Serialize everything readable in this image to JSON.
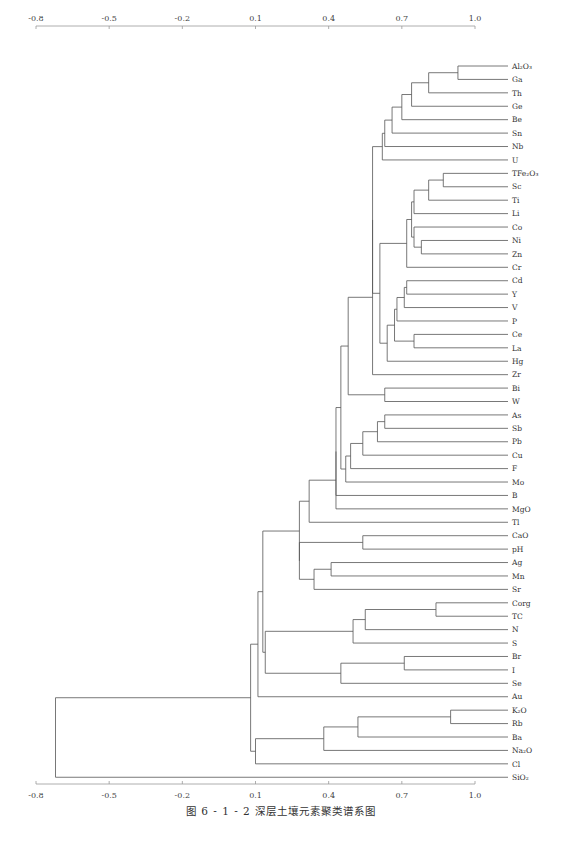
{
  "chart_data": {
    "type": "dendrogram",
    "xlabel": "",
    "ylabel": "",
    "x_ticks": [
      -0.8,
      -0.5,
      -0.2,
      0.1,
      0.4,
      0.7,
      1.0
    ],
    "x_tick_labels": [
      "-0.8",
      "-0.5",
      "-0.2",
      "0.1",
      "0.4",
      "0.7",
      "1.0"
    ],
    "xlim": [
      -0.8,
      1.0
    ],
    "axes": [
      "top",
      "bottom"
    ],
    "grid": false,
    "leaves": [
      "Al2O3",
      "Ga",
      "Th",
      "Ge",
      "Be",
      "Sn",
      "Nb",
      "U",
      "TFe2O3",
      "Sc",
      "Ti",
      "Li",
      "Co",
      "Ni",
      "Zn",
      "Cr",
      "Cd",
      "Y",
      "V",
      "P",
      "Ce",
      "La",
      "Hg",
      "Zr",
      "Bi",
      "W",
      "As",
      "Sb",
      "Pb",
      "Cu",
      "F",
      "Mo",
      "B",
      "MgO",
      "Tl",
      "CaO",
      "pH",
      "Ag",
      "Mn",
      "Sr",
      "Corg",
      "TC",
      "N",
      "S",
      "Br",
      "I",
      "Se",
      "Au",
      "K2O",
      "Rb",
      "Ba",
      "Na2O",
      "Cl",
      "SiO2"
    ],
    "leaf_display": [
      "Al₂O₃",
      "Ga",
      "Th",
      "Ge",
      "Be",
      "Sn",
      "Nb",
      "U",
      "TFe₂O₃",
      "Sc",
      "Ti",
      "Li",
      "Co",
      "Ni",
      "Zn",
      "Cr",
      "Cd",
      "Y",
      "V",
      "P",
      "Ce",
      "La",
      "Hg",
      "Zr",
      "Bi",
      "W",
      "As",
      "Sb",
      "Pb",
      "Cu",
      "F",
      "Mo",
      "B",
      "MgO",
      "Tl",
      "CaO",
      "pH",
      "Ag",
      "Mn",
      "Sr",
      "Corg",
      "TC",
      "N",
      "S",
      "Br",
      "I",
      "Se",
      "Au",
      "K₂O",
      "Rb",
      "Ba",
      "Na₂O",
      "Cl",
      "SiO₂"
    ],
    "merges": [
      {
        "id": "n1",
        "a": "Al2O3",
        "b": "Ga",
        "sim": 0.93
      },
      {
        "id": "n2",
        "a": "n1",
        "b": "Th",
        "sim": 0.81
      },
      {
        "id": "n3",
        "a": "n2",
        "b": "Ge",
        "sim": 0.74
      },
      {
        "id": "n4",
        "a": "n3",
        "b": "Be",
        "sim": 0.7
      },
      {
        "id": "n5",
        "a": "n4",
        "b": "Sn",
        "sim": 0.66
      },
      {
        "id": "n6",
        "a": "n5",
        "b": "Nb",
        "sim": 0.63
      },
      {
        "id": "n7",
        "a": "n6",
        "b": "U",
        "sim": 0.62
      },
      {
        "id": "n8",
        "a": "TFe2O3",
        "b": "Sc",
        "sim": 0.87
      },
      {
        "id": "n9",
        "a": "n8",
        "b": "Ti",
        "sim": 0.81
      },
      {
        "id": "n10",
        "a": "n9",
        "b": "Li",
        "sim": 0.75
      },
      {
        "id": "n11",
        "a": "Ni",
        "b": "Zn",
        "sim": 0.78
      },
      {
        "id": "n12",
        "a": "Co",
        "b": "n11",
        "sim": 0.75
      },
      {
        "id": "n13",
        "a": "n10",
        "b": "n12",
        "sim": 0.74
      },
      {
        "id": "n14",
        "a": "n13",
        "b": "Cr",
        "sim": 0.72
      },
      {
        "id": "n15",
        "a": "Cd",
        "b": "Y",
        "sim": 0.72
      },
      {
        "id": "n16",
        "a": "n15",
        "b": "V",
        "sim": 0.71
      },
      {
        "id": "n17",
        "a": "n16",
        "b": "P",
        "sim": 0.68
      },
      {
        "id": "n18",
        "a": "Ce",
        "b": "La",
        "sim": 0.75
      },
      {
        "id": "n19",
        "a": "n17",
        "b": "n18",
        "sim": 0.67
      },
      {
        "id": "n20",
        "a": "n19",
        "b": "Hg",
        "sim": 0.64
      },
      {
        "id": "n21",
        "a": "n14",
        "b": "n20",
        "sim": 0.61
      },
      {
        "id": "n22",
        "a": "n7",
        "b": "n21",
        "sim": 0.58
      },
      {
        "id": "n23",
        "a": "n22",
        "b": "Zr",
        "sim": 0.58
      },
      {
        "id": "n24",
        "a": "Bi",
        "b": "W",
        "sim": 0.63
      },
      {
        "id": "n25",
        "a": "n23",
        "b": "n24",
        "sim": 0.48
      },
      {
        "id": "n26",
        "a": "As",
        "b": "Sb",
        "sim": 0.63
      },
      {
        "id": "n27",
        "a": "n26",
        "b": "Pb",
        "sim": 0.6
      },
      {
        "id": "n28",
        "a": "n27",
        "b": "Cu",
        "sim": 0.54
      },
      {
        "id": "n29",
        "a": "n28",
        "b": "F",
        "sim": 0.49
      },
      {
        "id": "n30",
        "a": "n29",
        "b": "Mo",
        "sim": 0.47
      },
      {
        "id": "n31",
        "a": "n25",
        "b": "n30",
        "sim": 0.45
      },
      {
        "id": "n32",
        "a": "n31",
        "b": "B",
        "sim": 0.43
      },
      {
        "id": "n33",
        "a": "n32",
        "b": "MgO",
        "sim": 0.43
      },
      {
        "id": "n34",
        "a": "n33",
        "b": "Tl",
        "sim": 0.32
      },
      {
        "id": "n35",
        "a": "CaO",
        "b": "pH",
        "sim": 0.54
      },
      {
        "id": "n36",
        "a": "Ag",
        "b": "Mn",
        "sim": 0.41
      },
      {
        "id": "n37",
        "a": "n36",
        "b": "Sr",
        "sim": 0.34
      },
      {
        "id": "n38",
        "a": "n35",
        "b": "n37",
        "sim": 0.28
      },
      {
        "id": "n39",
        "a": "n34",
        "b": "n38",
        "sim": 0.28
      },
      {
        "id": "n40",
        "a": "Corg",
        "b": "TC",
        "sim": 0.84
      },
      {
        "id": "n41",
        "a": "n40",
        "b": "N",
        "sim": 0.55
      },
      {
        "id": "n42",
        "a": "n41",
        "b": "S",
        "sim": 0.5
      },
      {
        "id": "n43",
        "a": "Br",
        "b": "I",
        "sim": 0.71
      },
      {
        "id": "n44",
        "a": "n43",
        "b": "Se",
        "sim": 0.45
      },
      {
        "id": "n45",
        "a": "n42",
        "b": "n44",
        "sim": 0.14
      },
      {
        "id": "n46",
        "a": "n39",
        "b": "n45",
        "sim": 0.13
      },
      {
        "id": "n47",
        "a": "n46",
        "b": "Au",
        "sim": 0.11
      },
      {
        "id": "n48",
        "a": "K2O",
        "b": "Rb",
        "sim": 0.9
      },
      {
        "id": "n49",
        "a": "n48",
        "b": "Ba",
        "sim": 0.52
      },
      {
        "id": "n50",
        "a": "n49",
        "b": "Na2O",
        "sim": 0.38
      },
      {
        "id": "n51",
        "a": "n50",
        "b": "Cl",
        "sim": 0.1
      },
      {
        "id": "n52",
        "a": "n47",
        "b": "n51",
        "sim": 0.08
      },
      {
        "id": "n53",
        "a": "n52",
        "b": "SiO2",
        "sim": -0.72
      }
    ]
  },
  "caption": "图 6 - 1 - 2   深层土壤元素聚类谱系图"
}
